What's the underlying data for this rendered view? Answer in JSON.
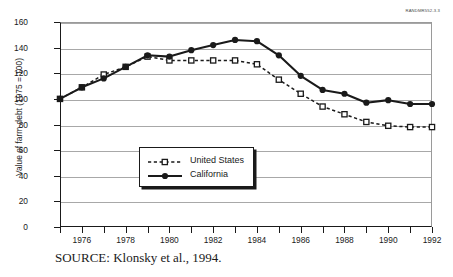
{
  "corner_tag": "RANDMR552-3.3",
  "source_caption": "SOURCE:  Klonsky et al., 1994.",
  "legend": {
    "position": "inside-lower-left",
    "entries": [
      {
        "label": "United States",
        "marker": "open-square",
        "line": "dashed",
        "color": "#1a1a1a"
      },
      {
        "label": "California",
        "marker": "filled-circle",
        "line": "solid",
        "color": "#1a1a1a"
      }
    ]
  },
  "chart_data": {
    "type": "line",
    "title": "",
    "subtitle": "",
    "xlabel": "",
    "ylabel": "Value of farm debt (1975 = 100)",
    "xlim": [
      1975,
      1992
    ],
    "ylim": [
      0,
      160
    ],
    "yticks": [
      0,
      20,
      40,
      60,
      80,
      100,
      120,
      140,
      160
    ],
    "xticks": [
      1975,
      1976,
      1977,
      1978,
      1979,
      1980,
      1981,
      1982,
      1983,
      1984,
      1985,
      1986,
      1987,
      1988,
      1989,
      1990,
      1991,
      1992
    ],
    "xtick_labels_shown": [
      1976,
      1978,
      1980,
      1982,
      1984,
      1986,
      1988,
      1990,
      1992
    ],
    "grid": "horizontal",
    "x": [
      1975,
      1976,
      1977,
      1978,
      1979,
      1980,
      1981,
      1982,
      1983,
      1984,
      1985,
      1986,
      1987,
      1988,
      1989,
      1990,
      1991,
      1992
    ],
    "series": [
      {
        "name": "United States",
        "marker": "open-square",
        "line": "dashed",
        "color": "#1a1a1a",
        "values": [
          100,
          109,
          119,
          125,
          133,
          130,
          130,
          130,
          130,
          127,
          115,
          104,
          94,
          88,
          82,
          79,
          78,
          78
        ]
      },
      {
        "name": "California",
        "marker": "filled-circle",
        "line": "solid",
        "color": "#1a1a1a",
        "values": [
          100,
          109,
          116,
          125,
          134,
          133,
          138,
          142,
          146,
          145,
          134,
          118,
          107,
          104,
          97,
          99,
          96,
          96
        ]
      }
    ]
  }
}
